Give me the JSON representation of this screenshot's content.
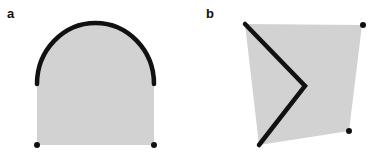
{
  "figure": {
    "width": 374,
    "height": 161,
    "colors": {
      "fill": "#d2d2d2",
      "stroke": "#111111",
      "point": "#111111"
    },
    "panels": [
      {
        "label": "a",
        "label_pos": [
          7,
          7
        ],
        "shape": "arch (rectangle topped by semicircle)",
        "fill_path": "M 37 84 A 58.5 61 0 0 1 154 84 L 154 145 L 37 145 Z",
        "thick_curve": "M 37 84 A 58.5 61 0 0 1 154 84",
        "points": [
          [
            37,
            145
          ],
          [
            154,
            145
          ]
        ]
      },
      {
        "label": "b",
        "label_pos": [
          206,
          7
        ],
        "shape": "quadrilateral with chevron edge",
        "fill_polygon": "245,24 362,25 349,131 259,145",
        "thick_polyline": "245,24 305,86 259,145",
        "points": [
          [
            363,
            25
          ],
          [
            349,
            131
          ]
        ]
      }
    ]
  }
}
